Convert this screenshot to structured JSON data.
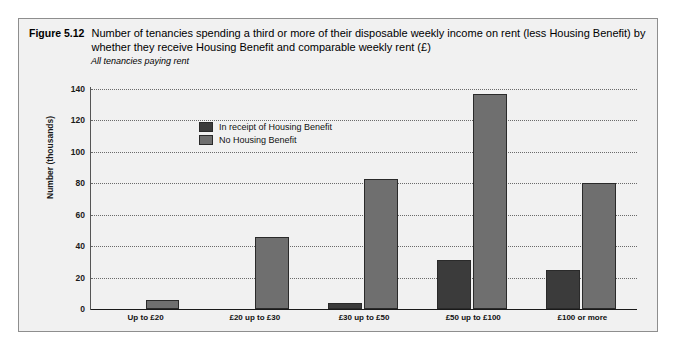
{
  "figure": {
    "number": "Figure 5.12",
    "title": "Number of tenancies spending a third or more of their disposable weekly income on rent (less Housing Benefit) by whether they receive Housing Benefit and  comparable weekly rent (£)",
    "subtitle": "All tenancies paying rent"
  },
  "colors": {
    "series_in_receipt": "#3b3b3b",
    "series_no_benefit": "#6f6f6f",
    "panel_background": "#f1f1f1",
    "frame_border": "#8e8e8e",
    "gridline": "#6a6a6a",
    "axis": "#1a1a1a"
  },
  "chart_data": {
    "type": "bar",
    "title": "Number of tenancies spending a third or more of their disposable weekly income on rent (less Housing Benefit) by whether they receive Housing Benefit and  comparable weekly rent (£)",
    "subtitle": "All tenancies paying rent",
    "xlabel": "",
    "ylabel": "Number (thousands)",
    "ylim": [
      0,
      140
    ],
    "yticks": [
      0,
      20,
      40,
      60,
      80,
      100,
      120,
      140
    ],
    "ytick_labels": [
      "0",
      "20",
      "40",
      "60",
      "80",
      "100",
      "120",
      "140"
    ],
    "grid": true,
    "legend_position": "inside-top-left",
    "categories": [
      "Up to £20",
      "£20 up to £30",
      "£30 up to £50",
      "£50 up to £100",
      "£100 or more"
    ],
    "series": [
      {
        "name": "In receipt of Housing Benefit",
        "color": "#3b3b3b",
        "values": [
          0,
          0,
          4,
          31,
          25
        ]
      },
      {
        "name": "No Housing Benefit",
        "color": "#6f6f6f",
        "values": [
          6,
          46,
          83,
          137,
          80
        ]
      }
    ]
  }
}
